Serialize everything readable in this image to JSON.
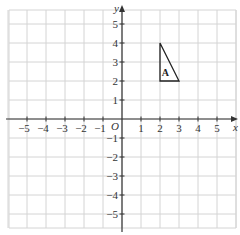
{
  "chart_data": {
    "type": "scatter",
    "title": "",
    "xlabel": "x",
    "ylabel": "y",
    "origin_label": "O",
    "xlim": [
      -6,
      6
    ],
    "ylim": [
      -6,
      6
    ],
    "grid": true,
    "x_ticks": [
      -5,
      -4,
      -3,
      -2,
      -1,
      1,
      2,
      3,
      4,
      5
    ],
    "y_ticks": [
      -5,
      -4,
      -3,
      -2,
      -1,
      1,
      2,
      3,
      4,
      5
    ],
    "shapes": [
      {
        "name": "A",
        "type": "triangle",
        "vertices": [
          [
            2,
            4
          ],
          [
            2,
            2
          ],
          [
            3,
            2
          ]
        ]
      }
    ]
  }
}
